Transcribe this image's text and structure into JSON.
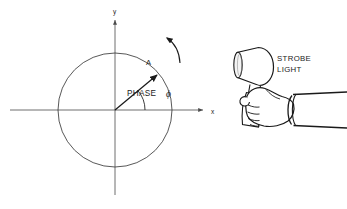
{
  "figure": {
    "width": 347,
    "height": 209,
    "background": "#ffffff",
    "ink": "#1a1a1a",
    "axis_color": "#4a4a4a",
    "circle_color": "#3a3a3a"
  },
  "axes": {
    "x_label": "x",
    "y_label": "y",
    "origin": {
      "x": 115,
      "y": 110
    },
    "x_start": {
      "x": 10,
      "y": 110
    },
    "x_end": {
      "x": 205,
      "y": 110
    },
    "y_start": {
      "x": 115,
      "y": 195
    },
    "y_end": {
      "x": 115,
      "y": 18
    },
    "x_label_pos": {
      "x": 211,
      "y": 113
    },
    "y_label_pos": {
      "x": 116,
      "y": 13
    }
  },
  "circle": {
    "center": {
      "x": 115,
      "y": 110
    },
    "radius": 57,
    "stroke_width": 0.8
  },
  "phasor": {
    "label": "A",
    "label_pos": {
      "x": 148,
      "y": 64
    },
    "angle_degrees": 40,
    "length": 56,
    "tip": {
      "x": 158,
      "y": 74
    },
    "arrow_color": "#1a1a1a"
  },
  "phase_angle": {
    "text": "PHASE",
    "symbol": "ϕ",
    "text_pos": {
      "x": 127,
      "y": 95
    },
    "symbol_pos": {
      "x": 168,
      "y": 96
    },
    "arc_radius": 30,
    "arc_start_deg": 0,
    "arc_end_deg": 40
  },
  "rotation_arrow": {
    "name": "counterclockwise-rotation-arrow",
    "direction": "counterclockwise",
    "start": {
      "x": 178,
      "y": 60
    },
    "end": {
      "x": 164,
      "y": 38
    },
    "arrowhead_at": "end"
  },
  "strobe": {
    "callout_line1": "STROBE",
    "callout_line2": "LIGHT",
    "callout_pos": {
      "x": 277,
      "y": 60
    },
    "head_center": {
      "x": 252,
      "y": 66
    },
    "lens_face": "ellipse",
    "handle": "tapered-grip"
  },
  "hand": {
    "name": "hand-gripping-handle",
    "wrist_cuff": "sleeve-cuff-arc",
    "sleeve_extends_to_edge": true
  }
}
